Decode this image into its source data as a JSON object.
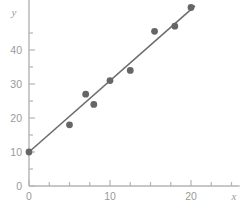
{
  "chart_data": {
    "type": "scatter",
    "title": "",
    "subtitle": "",
    "xlabel": "x",
    "ylabel": "y",
    "xlim": [
      0,
      26
    ],
    "ylim": [
      0,
      55
    ],
    "grid": false,
    "legend": null,
    "x_ticks": [
      0,
      10,
      20
    ],
    "x_tick_labels": [
      "0",
      "10",
      "20"
    ],
    "x_minor_ticks": [
      2.5,
      5,
      7.5,
      12.5,
      15,
      17.5,
      22.5,
      25
    ],
    "y_ticks": [
      0,
      10,
      20,
      30,
      40
    ],
    "y_tick_labels": [
      "0",
      "10",
      "20",
      "30",
      "40"
    ],
    "y_minor_ticks": [
      5,
      15,
      25,
      35,
      45
    ],
    "points": [
      {
        "x": 0.0,
        "y": 10.0
      },
      {
        "x": 5.0,
        "y": 18.0
      },
      {
        "x": 7.0,
        "y": 27.0
      },
      {
        "x": 8.0,
        "y": 24.0
      },
      {
        "x": 10.0,
        "y": 31.0
      },
      {
        "x": 12.5,
        "y": 34.0
      },
      {
        "x": 15.5,
        "y": 45.5
      },
      {
        "x": 18.0,
        "y": 47.0
      },
      {
        "x": 20.0,
        "y": 52.5
      }
    ],
    "trendline": {
      "type": "line",
      "x_start": 0.0,
      "y_start": 10.0,
      "x_end": 20.5,
      "y_end": 53.0
    },
    "colors": {
      "point": "#666666",
      "line": "#6e6e6e",
      "axis": "#b4b4b4",
      "tick_label": "#9a9a9a",
      "axis_title": "#9a9a9a",
      "background": "#ffffff"
    }
  }
}
